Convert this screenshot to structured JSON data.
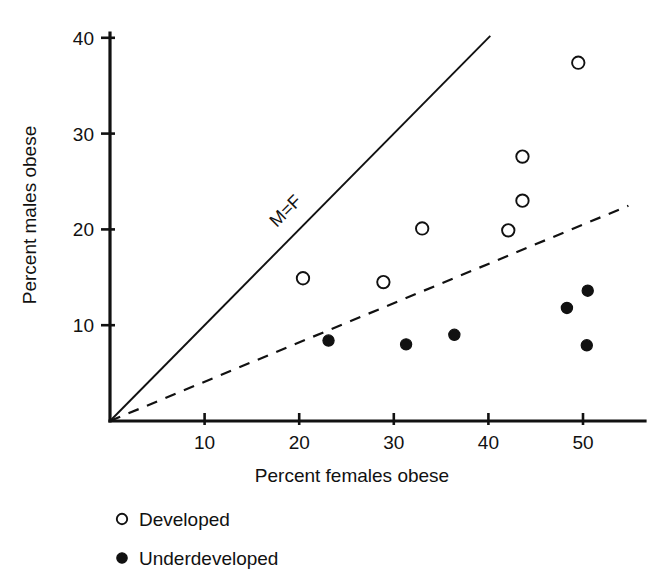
{
  "chart_data": {
    "type": "scatter",
    "title": "",
    "xlabel": "Percent females obese",
    "ylabel": "Percent males obese",
    "xlim": [
      0,
      55
    ],
    "ylim": [
      0,
      41
    ],
    "xticks": [
      10,
      20,
      30,
      40,
      50
    ],
    "yticks": [
      10,
      20,
      30,
      40
    ],
    "xtick_labels": [
      "10",
      "20",
      "30",
      "40",
      "50"
    ],
    "ytick_labels": [
      "10",
      "20",
      "30",
      "40"
    ],
    "grid": false,
    "legend_position": "below-left",
    "annotations": [
      {
        "text": "M=F",
        "x": 19.0,
        "y": 21.5,
        "rotation": -45,
        "describes": "identity-line"
      }
    ],
    "reference_lines": [
      {
        "name": "identity-line",
        "label": "M=F",
        "style": "solid",
        "slope": 1.0,
        "intercept": 0,
        "x_start": 0,
        "x_end": 40.2
      },
      {
        "name": "trend-line",
        "label": "",
        "style": "dashed",
        "slope": 0.41,
        "intercept": 0,
        "x_start": 0,
        "x_end": 54.8
      }
    ],
    "series": [
      {
        "name": "Developed",
        "marker": "open-circle",
        "color": "#111111",
        "points": [
          {
            "x": 20.4,
            "y": 14.9
          },
          {
            "x": 28.9,
            "y": 14.5
          },
          {
            "x": 33.0,
            "y": 20.1
          },
          {
            "x": 42.1,
            "y": 19.9
          },
          {
            "x": 43.6,
            "y": 23.0
          },
          {
            "x": 43.6,
            "y": 27.6
          },
          {
            "x": 49.5,
            "y": 37.4
          }
        ]
      },
      {
        "name": "Underdeveloped",
        "marker": "filled-circle",
        "color": "#111111",
        "points": [
          {
            "x": 23.1,
            "y": 8.4
          },
          {
            "x": 31.3,
            "y": 8.0
          },
          {
            "x": 36.4,
            "y": 9.0
          },
          {
            "x": 48.3,
            "y": 11.8
          },
          {
            "x": 50.5,
            "y": 13.6
          },
          {
            "x": 50.4,
            "y": 7.9
          }
        ]
      }
    ]
  },
  "legend": {
    "items": [
      {
        "label": "Developed",
        "marker": "open-circle"
      },
      {
        "label": "Underdeveloped",
        "marker": "filled-circle"
      }
    ]
  },
  "colors": {
    "ink": "#111111",
    "background": "#ffffff"
  }
}
